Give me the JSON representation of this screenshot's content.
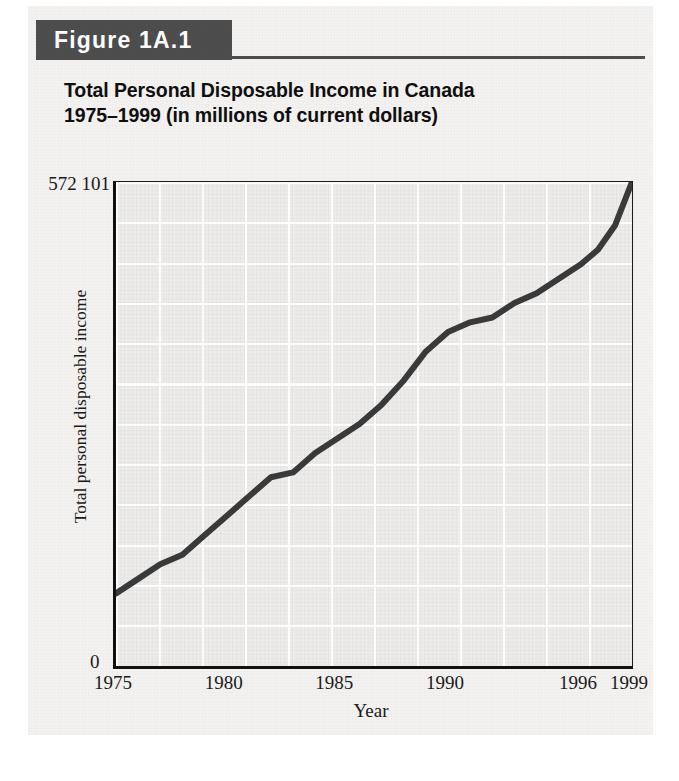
{
  "figure": {
    "banner_label": "Figure 1A.1",
    "title_line1": "Total Personal Disposable Income in Canada",
    "title_line2": "1975–1999 (in millions of current dollars)",
    "banner_bg": "#4d4d4d",
    "banner_text_color": "#ffffff",
    "plot_bg": "#eeedeb",
    "card_bg": "#f3f2f0",
    "line_color": "#3a3a3a",
    "axis_color": "#121212"
  },
  "axes": {
    "y_max_label": "572 101",
    "y_zero_label": "0",
    "y_axis_title": "Total personal disposable income",
    "x_axis_title": "Year",
    "x_tick_labels": [
      "1975",
      "1980",
      "1985",
      "1990",
      "1996",
      "1999"
    ]
  },
  "chart_data": {
    "type": "line",
    "title": "Total Personal Disposable Income in Canada 1975–1999 (in millions of current dollars)",
    "xlabel": "Year",
    "ylabel": "Total personal disposable income",
    "units": "millions of current dollars",
    "grid": true,
    "legend": "none",
    "ylim": [
      0,
      572101
    ],
    "xlim": [
      1975,
      1999
    ],
    "y_ticks": [
      0,
      572101
    ],
    "y_tick_labels": [
      "0",
      "572 101"
    ],
    "x_ticks": [
      1975,
      1980,
      1985,
      1990,
      1996,
      1999
    ],
    "x_tick_labels": [
      "1975",
      "1980",
      "1985",
      "1990",
      "1996",
      "1999"
    ],
    "x_axis_scale_note": "tick spacing is uneven: 1975–1996 evenly spaced in 5-year steps, 1996–1999 compressed",
    "series": [
      {
        "name": "Total personal disposable income",
        "x": [
          1975,
          1976,
          1977,
          1978,
          1979,
          1980,
          1981,
          1982,
          1983,
          1984,
          1985,
          1986,
          1987,
          1988,
          1989,
          1990,
          1991,
          1992,
          1993,
          1994,
          1995,
          1996,
          1997,
          1998,
          1999
        ],
        "values": [
          88000,
          104000,
          118000,
          133000,
          152000,
          175000,
          203000,
          222000,
          231000,
          249000,
          269000,
          288000,
          308000,
          336000,
          371000,
          396000,
          404000,
          414000,
          428000,
          440000,
          456000,
          472000,
          494000,
          520000,
          572101
        ],
        "y_pixel_fraction_of_max": [
          0.15,
          0.18,
          0.21,
          0.23,
          0.27,
          0.31,
          0.35,
          0.39,
          0.4,
          0.44,
          0.47,
          0.5,
          0.54,
          0.59,
          0.65,
          0.69,
          0.71,
          0.72,
          0.75,
          0.77,
          0.8,
          0.83,
          0.86,
          0.91,
          1.0
        ]
      }
    ],
    "annotations": [
      {
        "text": "plateau (slower growth) around 1982–1983"
      },
      {
        "text": "plateau (slower growth) around 1990–1992"
      },
      {
        "text": "series ends at the plot's top-right corner at the maximum value 572 101"
      }
    ]
  }
}
